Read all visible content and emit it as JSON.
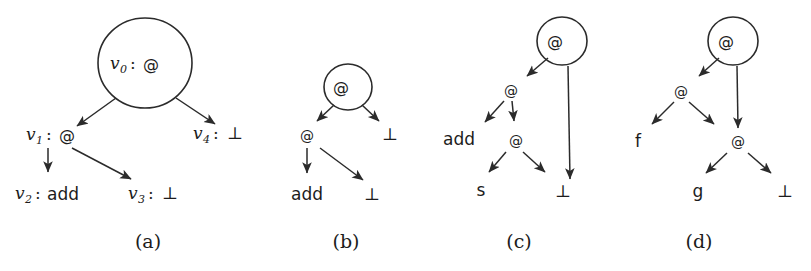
{
  "figure": {
    "kind": "term-graph-diagram",
    "background_color": "#ffffff",
    "ink_color": "#1c1c1c",
    "panels": [
      {
        "id": "a",
        "caption": "(a)",
        "nodes": [
          {
            "id": "v0",
            "var": "v",
            "sub": "0",
            "colon": ":",
            "symbol": "@",
            "boxed": true
          },
          {
            "id": "v1",
            "var": "v",
            "sub": "1",
            "colon": ":",
            "symbol": "@",
            "boxed": false
          },
          {
            "id": "v4",
            "var": "v",
            "sub": "4",
            "colon": ":",
            "symbol": "⊥",
            "boxed": false
          },
          {
            "id": "v2",
            "var": "v",
            "sub": "2",
            "colon": ":",
            "symbol": "add",
            "boxed": false
          },
          {
            "id": "v3",
            "var": "v",
            "sub": "3",
            "colon": ":",
            "symbol": "⊥",
            "boxed": false
          }
        ],
        "edges": [
          {
            "from": "v0",
            "to": "v1"
          },
          {
            "from": "v0",
            "to": "v4"
          },
          {
            "from": "v1",
            "to": "v2"
          },
          {
            "from": "v1",
            "to": "v3"
          }
        ]
      },
      {
        "id": "b",
        "caption": "(b)",
        "nodes": [
          {
            "id": "b0",
            "symbol": "@",
            "boxed": true
          },
          {
            "id": "b1",
            "symbol": "@",
            "boxed": false
          },
          {
            "id": "b2",
            "symbol": "⊥",
            "boxed": false
          },
          {
            "id": "b3",
            "symbol": "add",
            "boxed": false
          },
          {
            "id": "b4",
            "symbol": "⊥",
            "boxed": false
          }
        ],
        "edges": [
          {
            "from": "b0",
            "to": "b1"
          },
          {
            "from": "b0",
            "to": "b2"
          },
          {
            "from": "b1",
            "to": "b3"
          },
          {
            "from": "b1",
            "to": "b4"
          }
        ]
      },
      {
        "id": "c",
        "caption": "(c)",
        "nodes": [
          {
            "id": "c0",
            "symbol": "@",
            "boxed": true
          },
          {
            "id": "c1",
            "symbol": "@",
            "boxed": false
          },
          {
            "id": "c2",
            "symbol": "add",
            "boxed": false
          },
          {
            "id": "c3",
            "symbol": "@",
            "boxed": false
          },
          {
            "id": "c4",
            "symbol": "s",
            "boxed": false
          },
          {
            "id": "c5",
            "symbol": "⊥",
            "boxed": false
          }
        ],
        "edges": [
          {
            "from": "c0",
            "to": "c1"
          },
          {
            "from": "c0",
            "to": "c5"
          },
          {
            "from": "c1",
            "to": "c2"
          },
          {
            "from": "c1",
            "to": "c3"
          },
          {
            "from": "c3",
            "to": "c4"
          },
          {
            "from": "c3",
            "to": "c5"
          }
        ]
      },
      {
        "id": "d",
        "caption": "(d)",
        "nodes": [
          {
            "id": "d0",
            "symbol": "@",
            "boxed": true
          },
          {
            "id": "d1",
            "symbol": "@",
            "boxed": false
          },
          {
            "id": "d2",
            "symbol": "f",
            "boxed": false
          },
          {
            "id": "d3",
            "symbol": "@",
            "boxed": false
          },
          {
            "id": "d4",
            "symbol": "g",
            "boxed": false
          },
          {
            "id": "d5",
            "symbol": "⊥",
            "boxed": false
          }
        ],
        "edges": [
          {
            "from": "d0",
            "to": "d1"
          },
          {
            "from": "d0",
            "to": "d3"
          },
          {
            "from": "d1",
            "to": "d2"
          },
          {
            "from": "d1",
            "to": "d3"
          },
          {
            "from": "d3",
            "to": "d4"
          },
          {
            "from": "d3",
            "to": "d5"
          }
        ]
      }
    ]
  },
  "panel_a": {
    "caption": "(a)",
    "v0_var": "v",
    "v0_sub": "0",
    "v0_colon": ":",
    "v0_sym": "@",
    "v1_var": "v",
    "v1_sub": "1",
    "v1_colon": ":",
    "v1_sym": "@",
    "v4_var": "v",
    "v4_sub": "4",
    "v4_colon": ":",
    "v4_sym": "⊥",
    "v2_var": "v",
    "v2_sub": "2",
    "v2_colon": ":",
    "v2_sym": "add",
    "v3_var": "v",
    "v3_sub": "3",
    "v3_colon": ":",
    "v3_sym": "⊥"
  },
  "panel_b": {
    "caption": "(b)",
    "root": "@",
    "left": "@",
    "right": "⊥",
    "leaf_left": "add",
    "leaf_right": "⊥"
  },
  "panel_c": {
    "caption": "(c)",
    "root": "@",
    "n1": "@",
    "add": "add",
    "n2": "@",
    "s": "s",
    "bot": "⊥"
  },
  "panel_d": {
    "caption": "(d)",
    "root": "@",
    "n1": "@",
    "f": "f",
    "n2": "@",
    "g": "g",
    "bot": "⊥"
  }
}
